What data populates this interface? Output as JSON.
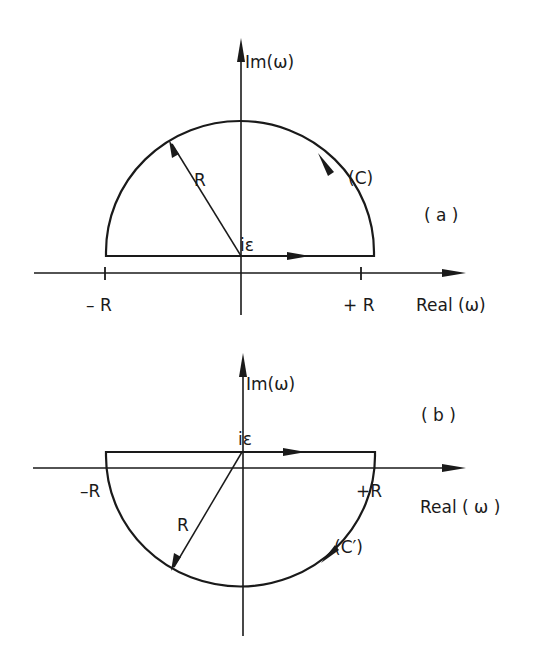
{
  "figure": {
    "background": "#ffffff",
    "ink": "#1a1a1a",
    "panels": [
      {
        "id": "a",
        "panel_label": "( a )",
        "im_axis_label": "Im(ω)",
        "real_axis_label": "Real (ω)",
        "origin_label": "iε",
        "radius_label": "R",
        "contour_label": "(C)",
        "neg_tick_label": "– R",
        "pos_tick_label": "+ R",
        "half_plane": "upper",
        "contour_direction": "counterclockwise"
      },
      {
        "id": "b",
        "panel_label": "( b )",
        "im_axis_label": "Im(ω)",
        "real_axis_label": "Real ( ω )",
        "origin_label": "iε",
        "radius_label": "R",
        "contour_label": "(C′)",
        "neg_tick_label": "–R",
        "pos_tick_label": "+R",
        "half_plane": "lower",
        "contour_direction": "clockwise"
      }
    ]
  }
}
